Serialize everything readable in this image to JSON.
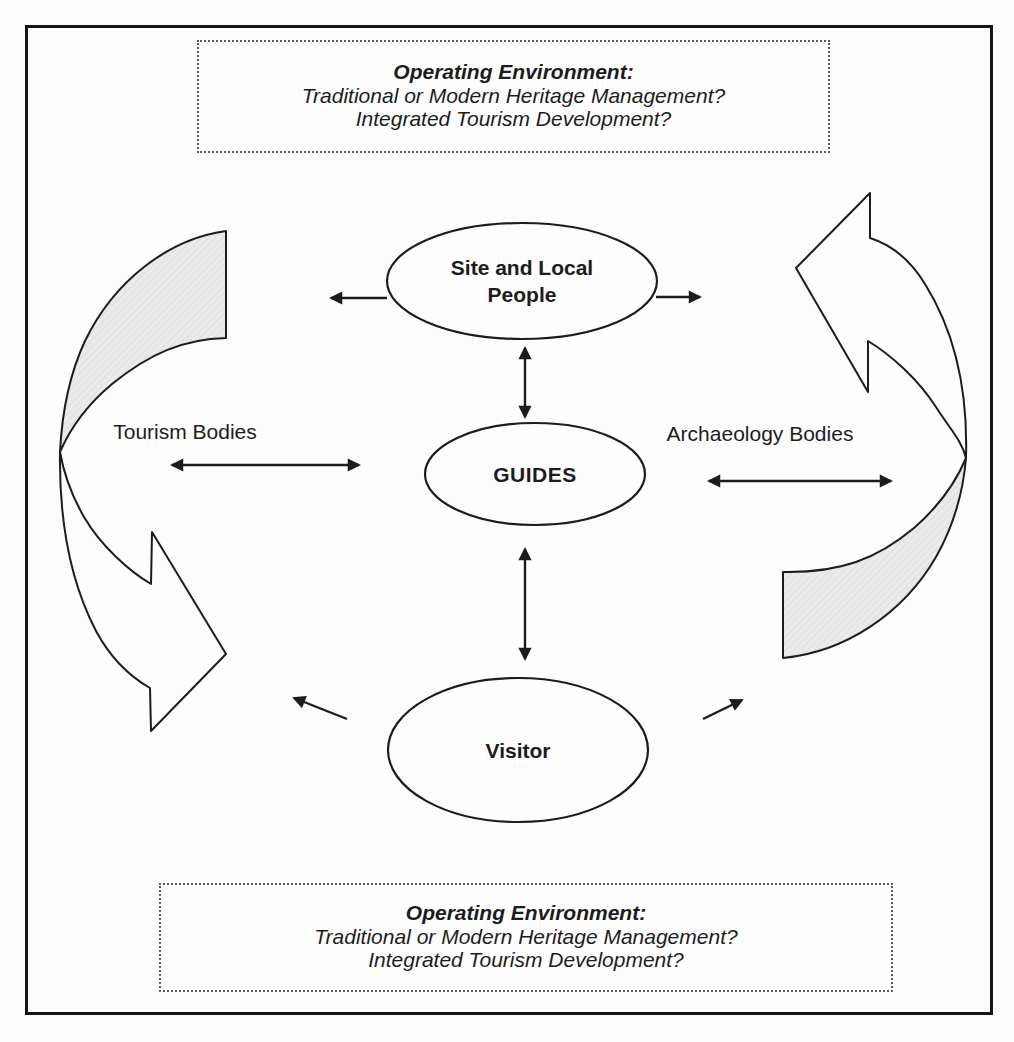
{
  "figure": {
    "top_box": {
      "title": "Operating Environment:",
      "line1": "Traditional or Modern Heritage Management?",
      "line2": "Integrated Tourism Development?"
    },
    "bottom_box": {
      "title": "Operating Environment:",
      "line1": "Traditional or Modern Heritage Management?",
      "line2": "Integrated Tourism Development?"
    },
    "nodes": {
      "site_people": "Site and Local People",
      "guides": "GUIDES",
      "visitor": "Visitor"
    },
    "side_labels": {
      "left": "Tourism Bodies",
      "right": "Archaeology Bodies"
    },
    "colors": {
      "line": "#1c1c1c",
      "shaded_arrow_fill": "#e9e9e9",
      "background": "#fdfdfd",
      "dotted_border": "#5a5a5a"
    }
  }
}
